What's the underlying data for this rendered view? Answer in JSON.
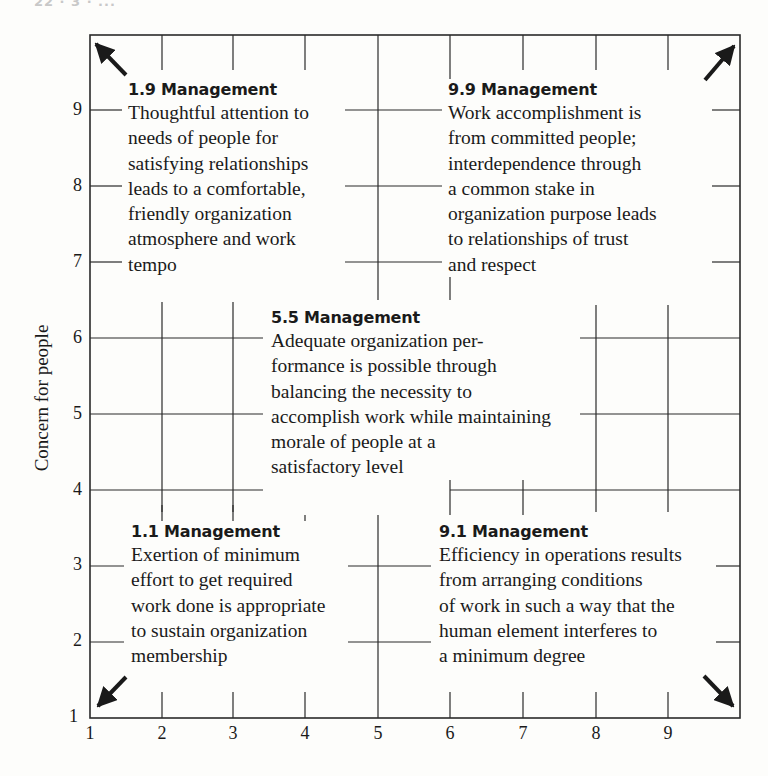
{
  "page": {
    "header": "22 · 3 · ..."
  },
  "diagram": {
    "y_axis": {
      "label": "Concern for people",
      "ticks": [
        "1",
        "2",
        "3",
        "4",
        "5",
        "6",
        "7",
        "8",
        "9"
      ]
    },
    "x_axis": {
      "label": "",
      "ticks": [
        "1",
        "2",
        "3",
        "4",
        "5",
        "6",
        "7",
        "8",
        "9"
      ]
    },
    "corner_arrows": [
      "top-left",
      "top-right",
      "bottom-left",
      "bottom-right"
    ],
    "styles": [
      {
        "id": "1.9",
        "title": "1.9 Management",
        "description": "Thoughtful attention to\nneeds of people for\nsatisfying relationships\nleads to a comfortable,\nfriendly organization\natmosphere and work\ntempo"
      },
      {
        "id": "9.9",
        "title": "9.9 Management",
        "description": "Work accomplishment is\nfrom committed people;\ninterdependence through\na common stake in\norganization purpose leads\nto relationships of trust\nand respect"
      },
      {
        "id": "5.5",
        "title": "5.5 Management",
        "description": "Adequate organization per-\nformance is possible through\nbalancing the necessity to\naccomplish work while maintaining\nmorale  of people at a\nsatisfactory level"
      },
      {
        "id": "1.1",
        "title": "1.1 Management",
        "description": "Exertion of minimum\neffort to get required\nwork done is appropriate\nto sustain organization\nmembership"
      },
      {
        "id": "9.1",
        "title": "9.1 Management",
        "description": "Efficiency in operations results\nfrom arranging conditions\nof work in such a way that the\nhuman element interferes to\na minimum degree"
      }
    ]
  }
}
